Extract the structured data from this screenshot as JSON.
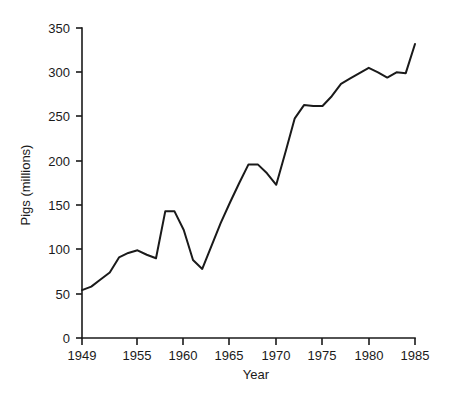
{
  "chart_data": {
    "type": "line",
    "title": "",
    "subtitle": "",
    "xlabel": "Year",
    "ylabel": "Pigs (millions)",
    "xlim": [
      1948,
      1986
    ],
    "ylim": [
      0,
      350
    ],
    "grid": false,
    "legend": null,
    "legend_position": "none",
    "line_color": "#1a1a1a",
    "background_color": "#ffffff",
    "x_ticks": [
      1949,
      1955,
      1960,
      1965,
      1970,
      1975,
      1980,
      1985
    ],
    "x_tick_labels": [
      "1949",
      "1955",
      "1960",
      "1965",
      "1970",
      "1975",
      "1980",
      "1985"
    ],
    "y_ticks": [
      0,
      50,
      100,
      150,
      200,
      250,
      300,
      350
    ],
    "y_tick_labels": [
      "0",
      "50",
      "100",
      "150",
      "200",
      "250",
      "300",
      "350"
    ],
    "series": [
      {
        "name": "Pigs (millions)",
        "x": [
          1949,
          1950,
          1951,
          1952,
          1953,
          1954,
          1955,
          1956,
          1957,
          1958,
          1959,
          1960,
          1961,
          1962,
          1963,
          1964,
          1965,
          1966,
          1967,
          1968,
          1969,
          1970,
          1971,
          1972,
          1973,
          1974,
          1975,
          1976,
          1977,
          1978,
          1979,
          1980,
          1981,
          1982,
          1983,
          1984,
          1985
        ],
        "values": [
          54,
          58,
          66,
          74,
          91,
          96,
          99,
          94,
          90,
          143,
          143,
          122,
          88,
          78,
          104,
          130,
          153,
          175,
          196,
          196,
          186,
          173,
          210,
          248,
          263,
          262,
          262,
          273,
          287,
          293,
          299,
          305,
          300,
          294,
          300,
          299,
          332
        ]
      }
    ]
  }
}
